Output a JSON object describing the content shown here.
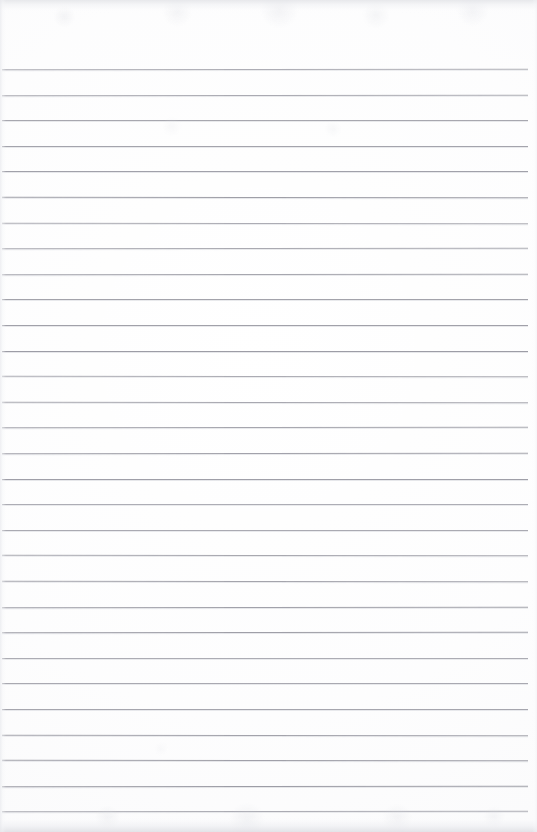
{
  "document": {
    "kind": "scanned-lined-paper",
    "title": "Blank ruled notebook page",
    "content_text": "",
    "page_width": 537,
    "page_height": 832
  },
  "paper": {
    "background_color": "#fdfdfd",
    "edge_shadow_color": "#e2e3e7",
    "has_margin_rule": false,
    "has_holes": false,
    "orientation": "portrait"
  },
  "ruling": {
    "line_color": "#9a9aa3",
    "line_thickness_px": 1,
    "line_spacing_px": 25.6,
    "first_line_y": 69,
    "line_count": 30,
    "line_start_x": 2,
    "line_end_x": 528,
    "lines_y": [
      69,
      94.6,
      120.2,
      145.8,
      171.4,
      197,
      222.6,
      248.2,
      273.8,
      299.4,
      325,
      350.6,
      376.2,
      401.8,
      427.4,
      453,
      478.6,
      504.2,
      529.8,
      555.4,
      581,
      606.6,
      632.2,
      657.8,
      683.4,
      709,
      734.6,
      760.2,
      785.8,
      811.4
    ]
  },
  "artifacts": {
    "top_band_height": 13,
    "bottom_band_height": 16,
    "left_band_width": 6,
    "right_band_width": 5,
    "noise_opacity": 0.55
  }
}
